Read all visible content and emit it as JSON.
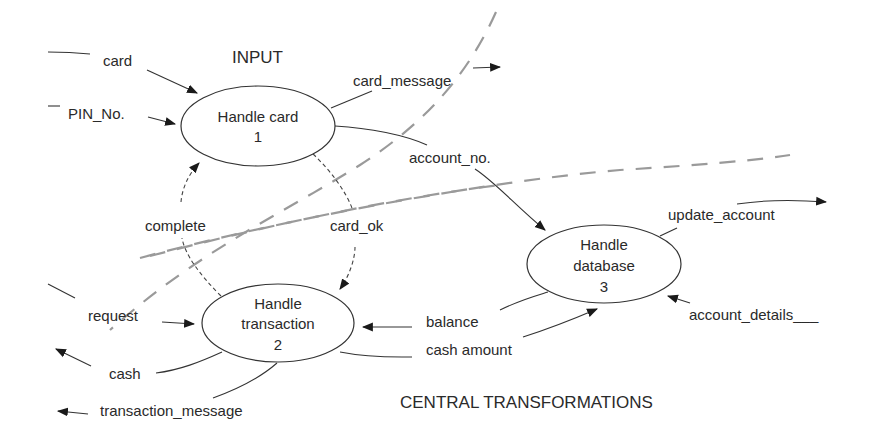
{
  "diagram": {
    "type": "data-flow-diagram",
    "regions": {
      "input": "INPUT",
      "central": "CENTRAL TRANSFORMATIONS"
    },
    "processes": [
      {
        "id": "1",
        "name": "Handle card",
        "number": "1"
      },
      {
        "id": "2",
        "name_line1": "Handle",
        "name_line2": "transaction",
        "number": "2"
      },
      {
        "id": "3",
        "name_line1": "Handle",
        "name_line2": "database",
        "number": "3"
      }
    ],
    "flows": {
      "card": "card",
      "pin_no": "PIN_No.",
      "card_message": "card_message",
      "account_no": "account_no.",
      "complete": "complete",
      "card_ok": "card_ok",
      "update_account": "update_account",
      "request": "request",
      "balance": "balance",
      "account_details": "account_details___",
      "cash": "cash",
      "cash_amount": "cash amount",
      "transaction_message": "transaction_message"
    },
    "colors": {
      "ink": "#2a2a2a",
      "boundary": "#9a9a9a",
      "background": "#ffffff"
    }
  }
}
